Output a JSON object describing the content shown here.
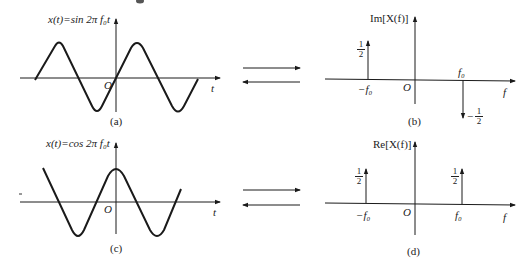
{
  "panels": {
    "a": {
      "caption": "(a)",
      "function_label": "x(t)=sin 2π f₀t",
      "origin_label": "O",
      "x_axis_label": "t"
    },
    "b": {
      "caption": "(b)",
      "y_axis_label": "Im[X(f)]",
      "origin_label": "O",
      "x_axis_label": "f",
      "neg_freq_label": "−f₀",
      "pos_freq_label": "f₀",
      "neg_impulse": {
        "num": "1",
        "den": "2",
        "sign": ""
      },
      "pos_impulse": {
        "num": "1",
        "den": "2",
        "sign": "−"
      }
    },
    "c": {
      "caption": "(c)",
      "function_label": "x(t)=cos 2π f₀t",
      "origin_label": "O",
      "x_axis_label": "t"
    },
    "d": {
      "caption": "(d)",
      "y_axis_label": "Re[X(f)]",
      "origin_label": "O",
      "x_axis_label": "f",
      "neg_freq_label": "−f₀",
      "pos_freq_label": "f₀",
      "neg_impulse": {
        "num": "1",
        "den": "2"
      },
      "pos_impulse": {
        "num": "1",
        "den": "2"
      }
    }
  },
  "transform_arrows": {
    "top": {
      "forward": "right-arrow-icon",
      "inverse": "left-arrow-icon"
    },
    "bottom": {
      "forward": "right-arrow-icon",
      "inverse": "left-arrow-icon"
    }
  },
  "colors": {
    "line": "#1a1a1a",
    "background": "#ffffff"
  }
}
